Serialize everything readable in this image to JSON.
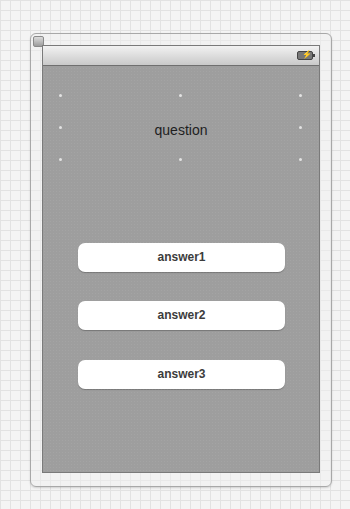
{
  "window": {
    "close_icon": "close-icon",
    "status_bar": {
      "battery_icon": "battery-charging-icon",
      "bolt_glyph": "⚡"
    }
  },
  "scene": {
    "question_label": "question",
    "answers": [
      {
        "label": "answer1"
      },
      {
        "label": "answer2"
      },
      {
        "label": "answer3"
      }
    ]
  },
  "colors": {
    "screen_background": "#9e9e9e",
    "button_background": "#ffffff",
    "button_text": "#3c3c3c",
    "question_text": "#1e1e1e"
  }
}
